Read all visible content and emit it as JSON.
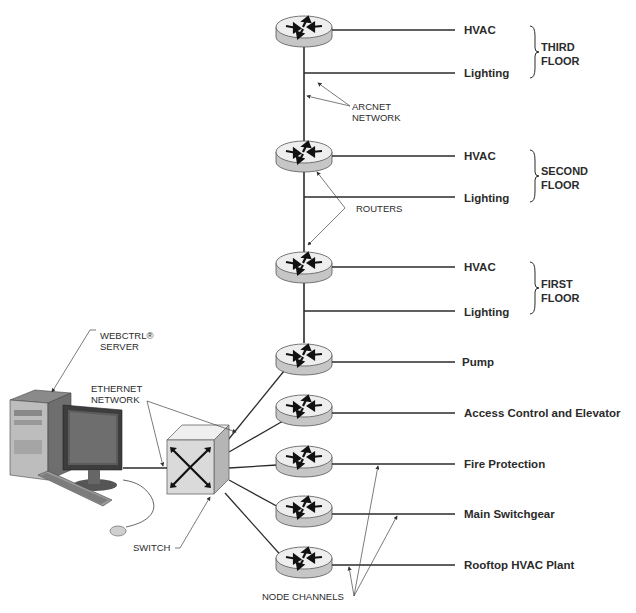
{
  "floors": [
    {
      "name_line1": "THIRD",
      "name_line2": "FLOOR",
      "devices": [
        "HVAC",
        "Lighting"
      ]
    },
    {
      "name_line1": "SECOND",
      "name_line2": "FLOOR",
      "devices": [
        "HVAC",
        "Lighting"
      ]
    },
    {
      "name_line1": "FIRST",
      "name_line2": "FLOOR",
      "devices": [
        "HVAC",
        "Lighting"
      ]
    }
  ],
  "systems": [
    "Pump",
    "Access Control and Elevator",
    "Fire Protection",
    "Main Switchgear",
    "Rooftop HVAC Plant"
  ],
  "callouts": {
    "arcnet_line1": "ARCNET",
    "arcnet_line2": "NETWORK",
    "routers": "ROUTERS",
    "server_line1": "WEBCTRL®",
    "server_line2": "SERVER",
    "ethernet_line1": "ETHERNET",
    "ethernet_line2": "NETWORK",
    "switch": "SWITCH",
    "node_channels": "NODE CHANNELS"
  },
  "colors": {
    "line": "#2b2b2b",
    "router_top": "#efefef",
    "router_side": "#c8c8c8",
    "switch_face": "#dcdcdc"
  }
}
